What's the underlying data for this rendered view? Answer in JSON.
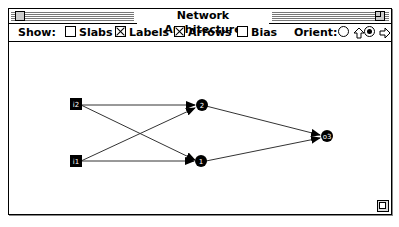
{
  "window": {
    "title": "Network Architecture"
  },
  "toolbar": {
    "show_label": "Show:",
    "options": [
      {
        "label": "Slabs",
        "checked": false
      },
      {
        "label": "Labels",
        "checked": true
      },
      {
        "label": "Arrows",
        "checked": true
      },
      {
        "label": "Bias",
        "checked": false
      }
    ],
    "orient_label": "Orient:",
    "orient_options": [
      {
        "icon": "arrow-up-icon",
        "selected": false
      },
      {
        "icon": "arrow-right-icon",
        "selected": true
      }
    ]
  },
  "network": {
    "nodes": [
      {
        "id": "i2",
        "label": "i2",
        "shape": "square"
      },
      {
        "id": "i1",
        "label": "i1",
        "shape": "square"
      },
      {
        "id": "2",
        "label": "2",
        "shape": "circle"
      },
      {
        "id": "1",
        "label": "1",
        "shape": "circle"
      },
      {
        "id": "o3",
        "label": "o3",
        "shape": "circle"
      }
    ],
    "edges": [
      [
        "i2",
        "2"
      ],
      [
        "i2",
        "1"
      ],
      [
        "i1",
        "2"
      ],
      [
        "i1",
        "1"
      ],
      [
        "2",
        "o3"
      ],
      [
        "1",
        "o3"
      ]
    ]
  }
}
